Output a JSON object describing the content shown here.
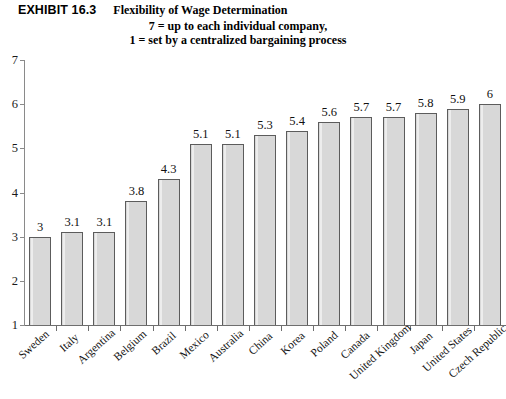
{
  "header": {
    "exhibit_number": "EXHIBIT 16.3",
    "exhibit_title": "Flexibility of Wage Determination",
    "subtitle_line1": "7 = up to each individual company,",
    "subtitle_line2": "1 = set by a centralized bargaining process"
  },
  "footer": {
    "note": ""
  },
  "style": {
    "bar_fill": "#d8d8d8",
    "bar_border": "#5c5c5c",
    "axis_color": "#6e6e6e",
    "text_color": "#111111"
  },
  "chart_data": {
    "type": "bar",
    "title": "Flexibility of Wage Determination",
    "subtitle": "7 = up to each individual company, 1 = set by a centralized bargaining process",
    "xlabel": "",
    "ylabel": "",
    "ylim": [
      1,
      7
    ],
    "yticks": [
      1,
      2,
      3,
      4,
      5,
      6,
      7
    ],
    "ytick_labels": [
      "1",
      "2",
      "3",
      "4",
      "5",
      "6",
      "7"
    ],
    "grid": false,
    "legend": false,
    "orientation": "vertical",
    "value_labels_shown": true,
    "categories": [
      "Sweden",
      "Italy",
      "Argentina",
      "Belgium",
      "Brazil",
      "Mexico",
      "Australia",
      "China",
      "Korea",
      "Poland",
      "Canada",
      "United Kingdom",
      "Japan",
      "United States",
      "Czech Republic"
    ],
    "values": [
      3,
      3.1,
      3.1,
      3.8,
      4.3,
      5.1,
      5.1,
      5.3,
      5.4,
      5.6,
      5.7,
      5.7,
      5.8,
      5.9,
      6
    ],
    "value_labels": [
      "3",
      "3.1",
      "3.1",
      "3.8",
      "4.3",
      "5.1",
      "5.1",
      "5.3",
      "5.4",
      "5.6",
      "5.7",
      "5.7",
      "5.8",
      "5.9",
      "6"
    ]
  }
}
